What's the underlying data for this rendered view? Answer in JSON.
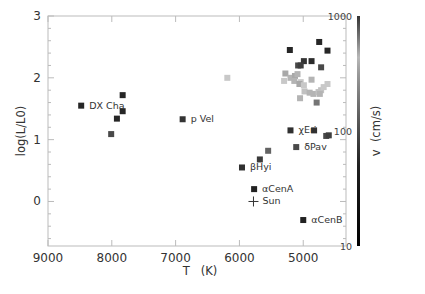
{
  "chart_data": {
    "type": "scatter",
    "title": "",
    "xlabel": "T   (K)",
    "ylabel": "log(L/L0)",
    "xlim": [
      9000,
      4330
    ],
    "ylim": [
      -0.72,
      3.0
    ],
    "x_reversed": true,
    "xticks": [
      9000,
      8000,
      7000,
      6000,
      5000
    ],
    "yticks": [
      0,
      1,
      2,
      3
    ],
    "grid": false,
    "colorbar": {
      "label": "v  (cm/s)",
      "scale": "log",
      "range": [
        10,
        1000
      ],
      "ticks": [
        "10",
        "100",
        "1000"
      ]
    },
    "points": [
      {
        "T": 8480,
        "logL": 1.55,
        "v": 15,
        "label": "DX Cha"
      },
      {
        "T": 7830,
        "logL": 1.72,
        "v": 15
      },
      {
        "T": 7830,
        "logL": 1.46,
        "v": 15
      },
      {
        "T": 7920,
        "logL": 1.34,
        "v": 15
      },
      {
        "T": 8010,
        "logL": 1.09,
        "v": 60
      },
      {
        "T": 6890,
        "logL": 1.33,
        "v": 30,
        "label": "p Vel"
      },
      {
        "T": 6190,
        "logL": 2.0,
        "v": 400
      },
      {
        "T": 5210,
        "logL": 2.45,
        "v": 15
      },
      {
        "T": 4750,
        "logL": 2.58,
        "v": 15
      },
      {
        "T": 4620,
        "logL": 2.44,
        "v": 15
      },
      {
        "T": 4990,
        "logL": 2.27,
        "v": 30
      },
      {
        "T": 5080,
        "logL": 2.2,
        "v": 60
      },
      {
        "T": 5040,
        "logL": 2.2,
        "v": 50
      },
      {
        "T": 4870,
        "logL": 2.27,
        "v": 20
      },
      {
        "T": 4720,
        "logL": 2.17,
        "v": 60
      },
      {
        "T": 5280,
        "logL": 2.07,
        "v": 250
      },
      {
        "T": 5200,
        "logL": 2.0,
        "v": 300
      },
      {
        "T": 5130,
        "logL": 2.03,
        "v": 250
      },
      {
        "T": 5090,
        "logL": 2.06,
        "v": 300
      },
      {
        "T": 5300,
        "logL": 1.95,
        "v": 400
      },
      {
        "T": 5140,
        "logL": 1.95,
        "v": 300
      },
      {
        "T": 5040,
        "logL": 1.93,
        "v": 400
      },
      {
        "T": 5060,
        "logL": 1.9,
        "v": 250
      },
      {
        "T": 4990,
        "logL": 1.88,
        "v": 400
      },
      {
        "T": 4870,
        "logL": 1.97,
        "v": 300
      },
      {
        "T": 4980,
        "logL": 1.78,
        "v": 350
      },
      {
        "T": 4900,
        "logL": 1.76,
        "v": 300
      },
      {
        "T": 4840,
        "logL": 1.74,
        "v": 300
      },
      {
        "T": 4720,
        "logL": 1.8,
        "v": 350
      },
      {
        "T": 4760,
        "logL": 1.77,
        "v": 350
      },
      {
        "T": 4680,
        "logL": 1.85,
        "v": 400
      },
      {
        "T": 4620,
        "logL": 1.9,
        "v": 400
      },
      {
        "T": 4740,
        "logL": 1.74,
        "v": 300
      },
      {
        "T": 5050,
        "logL": 1.67,
        "v": 300
      },
      {
        "T": 4790,
        "logL": 1.6,
        "v": 120
      },
      {
        "T": 5200,
        "logL": 1.15,
        "v": 25,
        "label": "χEri"
      },
      {
        "T": 4830,
        "logL": 1.15,
        "v": 25
      },
      {
        "T": 4640,
        "logL": 1.06,
        "v": 60
      },
      {
        "T": 4600,
        "logL": 1.07,
        "v": 50
      },
      {
        "T": 5110,
        "logL": 0.88,
        "v": 60,
        "label": "δPav"
      },
      {
        "T": 5550,
        "logL": 0.82,
        "v": 90
      },
      {
        "T": 5680,
        "logL": 0.68,
        "v": 40
      },
      {
        "T": 5960,
        "logL": 0.55,
        "v": 25,
        "label": "βHyi"
      },
      {
        "T": 5770,
        "logL": 0.2,
        "v": 12,
        "label": "αCenA"
      },
      {
        "T": 5000,
        "logL": -0.3,
        "v": 12,
        "label": "αCenB"
      }
    ],
    "markers": [
      {
        "T": 5780,
        "logL": 0.0,
        "symbol": "plus",
        "label": "Sun"
      }
    ]
  }
}
